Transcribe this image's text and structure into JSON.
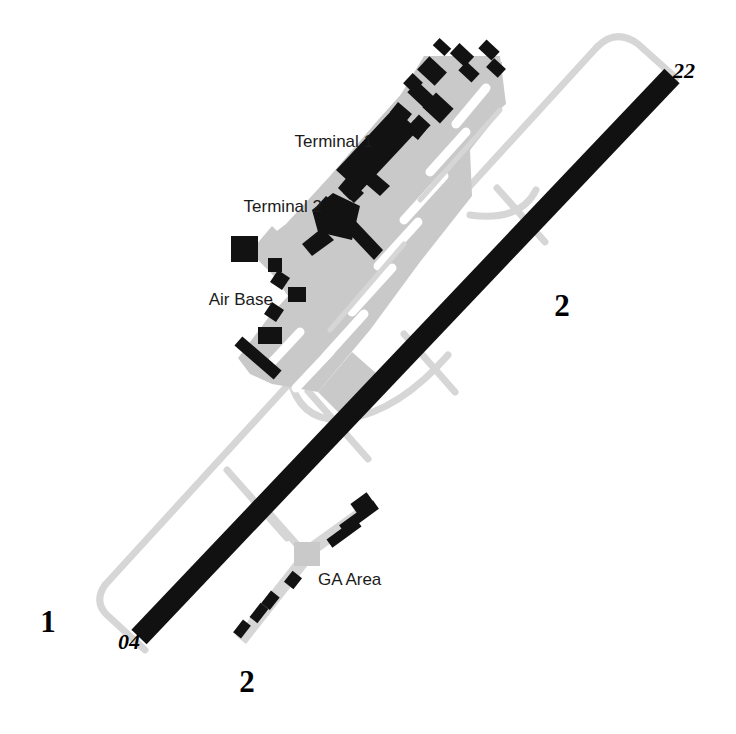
{
  "diagram": {
    "colors": {
      "background": "#ffffff",
      "runway": "#111111",
      "apron": "#c9c9c9",
      "taxiway_line": "#d6d6d6",
      "building": "#121212",
      "marking": "#ffffff",
      "text": "#1b1b1b"
    },
    "runway": {
      "name": "04/22",
      "threshold_low_label": "04",
      "threshold_high_label": "22",
      "heading_deg": 43
    },
    "labels": {
      "terminal_1": "Terminal 1",
      "terminal_2": "Terminal 2",
      "air_base": "Air Base",
      "ga_area": "GA Area"
    },
    "region_markers": {
      "west": "1",
      "east": "2",
      "south": "2"
    },
    "label_positions": {
      "terminal_1": {
        "x": 373,
        "y": 147,
        "anchor": "end"
      },
      "terminal_2": {
        "x": 322,
        "y": 212,
        "anchor": "end"
      },
      "air_base": {
        "x": 273,
        "y": 305,
        "anchor": "end"
      },
      "ga_area": {
        "x": 318,
        "y": 585,
        "anchor": "start"
      },
      "threshold_04": {
        "x": 129,
        "y": 649,
        "anchor": "middle"
      },
      "threshold_22": {
        "x": 673,
        "y": 78,
        "anchor": "start"
      },
      "marker_1": {
        "x": 48,
        "y": 632,
        "anchor": "middle"
      },
      "marker_2_east": {
        "x": 562,
        "y": 316,
        "anchor": "middle"
      },
      "marker_2_south": {
        "x": 247,
        "y": 692,
        "anchor": "middle"
      }
    }
  }
}
